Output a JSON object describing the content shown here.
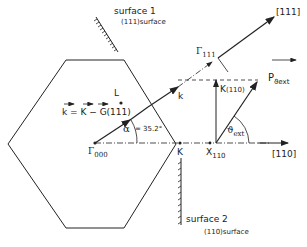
{
  "diagram": {
    "type": "Brillouin zone cross-section with wave vectors",
    "labels": {
      "surface1": "surface 1",
      "surface1_plane": "(111)surface",
      "surface2": "surface 2",
      "surface2_plane": "(110)surface",
      "dir_111": "[111]",
      "dir_110": "[110]",
      "gamma_111": "Γ",
      "gamma_111_sub": "111",
      "gamma_000": "Γ",
      "gamma_000_sub": "000",
      "point_L": "L",
      "point_K": "K",
      "point_X": "X",
      "point_X_sub": "110",
      "k_vec": "k",
      "k_eq": "k = K − G(111)",
      "k_para": "K",
      "k_para_tail": "(110)",
      "p_ext": "P",
      "p_ext_sub": "ϑext",
      "theta": "ϑ",
      "theta_sub": "ext",
      "alpha": "α",
      "alpha_value": "= 35.2°"
    },
    "colors": {
      "line": "#222222",
      "background": "#ffffff"
    }
  }
}
